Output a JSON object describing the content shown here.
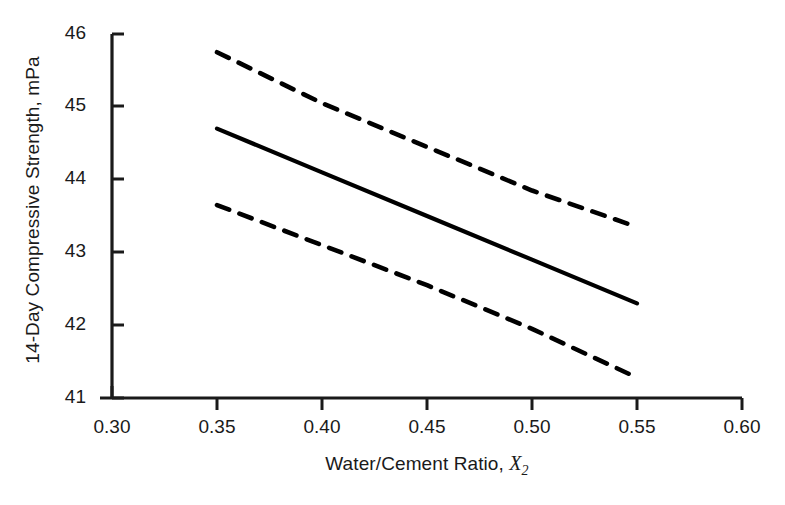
{
  "chart_data": {
    "type": "line",
    "title": "",
    "xlabel": "Water/Cement Ratio, X₂",
    "xlabel_parts": {
      "text": "Water/Cement Ratio, ",
      "variable": "X",
      "subscript": "2"
    },
    "ylabel": "14-Day Compressive Strength, mPa",
    "xlim": [
      0.3,
      0.6
    ],
    "ylim": [
      41,
      46
    ],
    "xticks": [
      "0.30",
      "0.35",
      "0.40",
      "0.45",
      "0.50",
      "0.55",
      "0.60"
    ],
    "xtick_values": [
      0.3,
      0.35,
      0.4,
      0.45,
      0.5,
      0.55,
      0.6
    ],
    "yticks": [
      "41",
      "42",
      "43",
      "44",
      "45",
      "46"
    ],
    "ytick_values": [
      41,
      42,
      43,
      44,
      45,
      46
    ],
    "grid": false,
    "legend": "none",
    "line_color": "#000000",
    "x": [
      0.35,
      0.4,
      0.45,
      0.5,
      0.55
    ],
    "series": [
      {
        "name": "Upper confidence limit",
        "style": "dashed",
        "values": [
          45.75,
          45.05,
          44.45,
          43.85,
          43.35
        ]
      },
      {
        "name": "Fitted regression line",
        "style": "solid",
        "values": [
          44.7,
          44.1,
          43.5,
          42.9,
          42.3
        ]
      },
      {
        "name": "Lower confidence limit",
        "style": "dashed",
        "values": [
          43.65,
          43.1,
          42.55,
          41.95,
          41.28
        ]
      }
    ]
  }
}
